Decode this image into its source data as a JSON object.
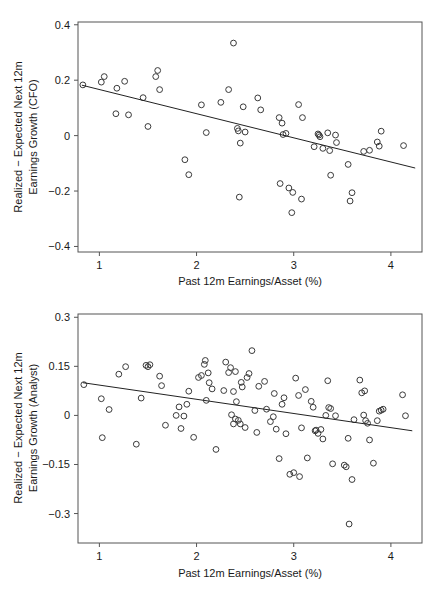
{
  "figure": {
    "panel_count": 2,
    "background_color": "#ffffff",
    "marker_color": "#3a3a3a",
    "line_color": "#222222",
    "axis_color": "#555555"
  },
  "chart_data": [
    {
      "type": "scatter",
      "id": "cfo",
      "title": "",
      "xlabel": "Past 12m Earnings/Asset (%)",
      "ylabel": "Realized − Expected Next 12m Earnings Growth (CFO)",
      "ylabel_line1": "Realized − Expected Next 12m",
      "ylabel_line2": "Earnings Growth (CFO)",
      "xlim": [
        0.78,
        4.32
      ],
      "ylim": [
        -0.42,
        0.41
      ],
      "xticks": [
        1,
        2,
        3,
        4
      ],
      "xticklabels": [
        "1",
        "2",
        "3",
        "4"
      ],
      "yticks": [
        0.4,
        0.2,
        0,
        -0.2,
        -0.4
      ],
      "yticklabels": [
        "0.4",
        "0.2",
        "0",
        "−0.2",
        "−0.4"
      ],
      "grid": false,
      "legend": "none",
      "fit_line": {
        "x": [
          0.82,
          4.25
        ],
        "y": [
          0.182,
          -0.117
        ],
        "label": "OLS fit"
      },
      "points": [
        [
          0.83,
          0.183
        ],
        [
          1.02,
          0.193
        ],
        [
          1.05,
          0.213
        ],
        [
          1.18,
          0.171
        ],
        [
          1.17,
          0.079
        ],
        [
          1.26,
          0.196
        ],
        [
          1.3,
          0.075
        ],
        [
          1.45,
          0.137
        ],
        [
          1.5,
          0.033
        ],
        [
          1.58,
          0.213
        ],
        [
          1.6,
          0.235
        ],
        [
          1.62,
          0.166
        ],
        [
          1.88,
          -0.087
        ],
        [
          1.92,
          -0.141
        ],
        [
          2.05,
          0.111
        ],
        [
          2.1,
          0.011
        ],
        [
          2.25,
          0.12
        ],
        [
          2.33,
          0.166
        ],
        [
          2.38,
          0.334
        ],
        [
          2.42,
          0.026
        ],
        [
          2.43,
          0.017
        ],
        [
          2.45,
          -0.027
        ],
        [
          2.44,
          -0.222
        ],
        [
          2.48,
          0.104
        ],
        [
          2.5,
          0.013
        ],
        [
          2.63,
          0.136
        ],
        [
          2.66,
          0.093
        ],
        [
          2.85,
          0.065
        ],
        [
          2.86,
          -0.173
        ],
        [
          2.88,
          0.045
        ],
        [
          2.89,
          0.004
        ],
        [
          2.92,
          0.008
        ],
        [
          2.95,
          -0.189
        ],
        [
          2.99,
          -0.205
        ],
        [
          2.98,
          -0.278
        ],
        [
          3.05,
          0.112
        ],
        [
          3.09,
          0.065
        ],
        [
          3.08,
          -0.229
        ],
        [
          3.21,
          -0.04
        ],
        [
          3.25,
          0.006
        ],
        [
          3.26,
          0.002
        ],
        [
          3.27,
          -0.004
        ],
        [
          3.3,
          -0.046
        ],
        [
          3.35,
          0.01
        ],
        [
          3.37,
          -0.054
        ],
        [
          3.38,
          -0.143
        ],
        [
          3.43,
          0.002
        ],
        [
          3.44,
          -0.025
        ],
        [
          3.56,
          -0.104
        ],
        [
          3.58,
          -0.236
        ],
        [
          3.6,
          -0.206
        ],
        [
          3.72,
          -0.057
        ],
        [
          3.78,
          -0.053
        ],
        [
          3.86,
          -0.023
        ],
        [
          3.88,
          -0.038
        ],
        [
          3.9,
          0.016
        ],
        [
          4.13,
          -0.036
        ]
      ]
    },
    {
      "type": "scatter",
      "id": "analyst",
      "title": "",
      "xlabel": "Past 12m Earnings/Asset (%)",
      "ylabel": "Realized − Expected Next 12m Earnings Growth (Analyst)",
      "ylabel_line1": "Realized − Expected Next 12m",
      "ylabel_line2": "Earnings Growth (Analyst)",
      "xlim": [
        0.78,
        4.32
      ],
      "ylim": [
        -0.39,
        0.31
      ],
      "xticks": [
        1,
        2,
        3,
        4
      ],
      "xticklabels": [
        "1",
        "2",
        "3",
        "4"
      ],
      "yticks": [
        0.3,
        0.15,
        0,
        -0.15,
        -0.3
      ],
      "yticklabels": [
        "0.3",
        "0.15",
        "0",
        "−0.15",
        "−0.3"
      ],
      "grid": false,
      "legend": "none",
      "fit_line": {
        "x": [
          0.83,
          4.22
        ],
        "y": [
          0.1,
          -0.047
        ],
        "label": "OLS fit"
      },
      "points": [
        [
          0.84,
          0.094
        ],
        [
          1.02,
          0.051
        ],
        [
          1.03,
          -0.068
        ],
        [
          1.1,
          0.018
        ],
        [
          1.2,
          0.126
        ],
        [
          1.27,
          0.149
        ],
        [
          1.38,
          -0.088
        ],
        [
          1.43,
          0.053
        ],
        [
          1.48,
          0.153
        ],
        [
          1.5,
          0.149
        ],
        [
          1.52,
          0.155
        ],
        [
          1.62,
          0.12
        ],
        [
          1.64,
          0.091
        ],
        [
          1.68,
          -0.03
        ],
        [
          1.79,
          0.0
        ],
        [
          1.82,
          0.026
        ],
        [
          1.84,
          -0.04
        ],
        [
          1.87,
          -0.002
        ],
        [
          1.9,
          0.034
        ],
        [
          1.92,
          0.074
        ],
        [
          1.97,
          -0.067
        ],
        [
          2.02,
          0.116
        ],
        [
          2.05,
          0.122
        ],
        [
          2.08,
          0.156
        ],
        [
          2.09,
          0.168
        ],
        [
          2.1,
          0.046
        ],
        [
          2.12,
          0.13
        ],
        [
          2.13,
          0.1
        ],
        [
          2.16,
          0.081
        ],
        [
          2.2,
          -0.104
        ],
        [
          2.28,
          0.076
        ],
        [
          2.3,
          0.163
        ],
        [
          2.33,
          0.131
        ],
        [
          2.35,
          0.146
        ],
        [
          2.36,
          0.002
        ],
        [
          2.38,
          0.073
        ],
        [
          2.38,
          -0.026
        ],
        [
          2.4,
          0.134
        ],
        [
          2.4,
          -0.011
        ],
        [
          2.41,
          0.042
        ],
        [
          2.43,
          -0.015
        ],
        [
          2.45,
          -0.026
        ],
        [
          2.46,
          0.101
        ],
        [
          2.47,
          0.087
        ],
        [
          2.5,
          -0.037
        ],
        [
          2.52,
          0.116
        ],
        [
          2.54,
          0.128
        ],
        [
          2.57,
          0.198
        ],
        [
          2.6,
          0.015
        ],
        [
          2.62,
          -0.052
        ],
        [
          2.64,
          0.089
        ],
        [
          2.7,
          0.104
        ],
        [
          2.72,
          0.019
        ],
        [
          2.76,
          -0.019
        ],
        [
          2.79,
          -0.004
        ],
        [
          2.8,
          0.067
        ],
        [
          2.82,
          -0.042
        ],
        [
          2.85,
          -0.132
        ],
        [
          2.88,
          0.034
        ],
        [
          2.9,
          0.054
        ],
        [
          2.92,
          -0.056
        ],
        [
          2.96,
          -0.18
        ],
        [
          3.0,
          -0.175
        ],
        [
          3.02,
          0.114
        ],
        [
          3.05,
          0.061
        ],
        [
          3.06,
          -0.187
        ],
        [
          3.08,
          -0.038
        ],
        [
          3.12,
          0.079
        ],
        [
          3.14,
          -0.13
        ],
        [
          3.18,
          0.043
        ],
        [
          3.2,
          0.025
        ],
        [
          3.22,
          -0.047
        ],
        [
          3.23,
          -0.045
        ],
        [
          3.25,
          -0.055
        ],
        [
          3.28,
          -0.043
        ],
        [
          3.3,
          -0.072
        ],
        [
          3.33,
          0.0
        ],
        [
          3.35,
          0.106
        ],
        [
          3.36,
          0.024
        ],
        [
          3.38,
          0.021
        ],
        [
          3.4,
          -0.148
        ],
        [
          3.43,
          -0.001
        ],
        [
          3.52,
          -0.152
        ],
        [
          3.54,
          -0.157
        ],
        [
          3.56,
          -0.07
        ],
        [
          3.57,
          -0.332
        ],
        [
          3.6,
          -0.196
        ],
        [
          3.62,
          -0.013
        ],
        [
          3.68,
          0.108
        ],
        [
          3.7,
          0.069
        ],
        [
          3.72,
          0.001
        ],
        [
          3.73,
          0.075
        ],
        [
          3.74,
          -0.016
        ],
        [
          3.76,
          -0.024
        ],
        [
          3.78,
          -0.075
        ],
        [
          3.82,
          -0.146
        ],
        [
          3.86,
          -0.016
        ],
        [
          3.88,
          0.013
        ],
        [
          3.9,
          0.016
        ],
        [
          3.92,
          0.019
        ],
        [
          4.12,
          0.063
        ],
        [
          4.15,
          -0.001
        ]
      ]
    }
  ]
}
